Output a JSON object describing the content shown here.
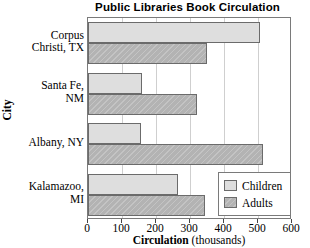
{
  "chart_data": {
    "type": "bar",
    "orientation": "horizontal",
    "title": "Public Libraries Book Circulation",
    "xlabel_bold": "Circulation",
    "xlabel_light": "(thousands)",
    "ylabel": "City",
    "categories": [
      "Corpus Christi, TX",
      "Santa Fe, NM",
      "Albany, NY",
      "Kalamazoo, MI"
    ],
    "category_lines": [
      [
        "Corpus",
        "Christi, TX"
      ],
      [
        "Santa Fe,",
        "NM"
      ],
      [
        "Albany, NY"
      ],
      [
        "Kalamazoo,",
        "MI"
      ]
    ],
    "series": [
      {
        "name": "Children",
        "color": "#dedede",
        "values": [
          505,
          160,
          155,
          265
        ]
      },
      {
        "name": "Adults",
        "color": "#b3b3b3",
        "values": [
          350,
          320,
          515,
          345
        ]
      }
    ],
    "xlim": [
      0,
      600
    ],
    "xticks": [
      0,
      100,
      200,
      300,
      400,
      500,
      600
    ],
    "xticklabels": [
      "0",
      "100",
      "200",
      "300",
      "400",
      "500",
      "600"
    ],
    "grid": true,
    "legend_position": "bottom-right",
    "legend_entries": [
      "Children",
      "Adults"
    ]
  },
  "colors": {
    "children": "#dedede",
    "adults": "#b3b3b3",
    "bar_border": "#6b6b6b",
    "frame": "#7a7a7a",
    "gridline": "#cfcfcf",
    "background": "#ffffff"
  }
}
